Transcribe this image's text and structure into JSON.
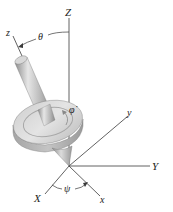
{
  "figure": {
    "type": "3D rigid body kinematics diagram (spinning top / gyroscope with Euler angles)",
    "axes_fixed": {
      "X": "X",
      "Y": "Y",
      "Z": "Z"
    },
    "axes_body": {
      "x": "x",
      "y": "y",
      "z": "z"
    },
    "angles": {
      "theta": "θ",
      "psi": "ψ",
      "phi_dot": "φ̇"
    },
    "colors": {
      "line": "#333333",
      "body_light": "#d9d9d9",
      "body_mid": "#b5b5b5",
      "body_dark": "#8c8c8c",
      "background": "#ffffff"
    }
  }
}
